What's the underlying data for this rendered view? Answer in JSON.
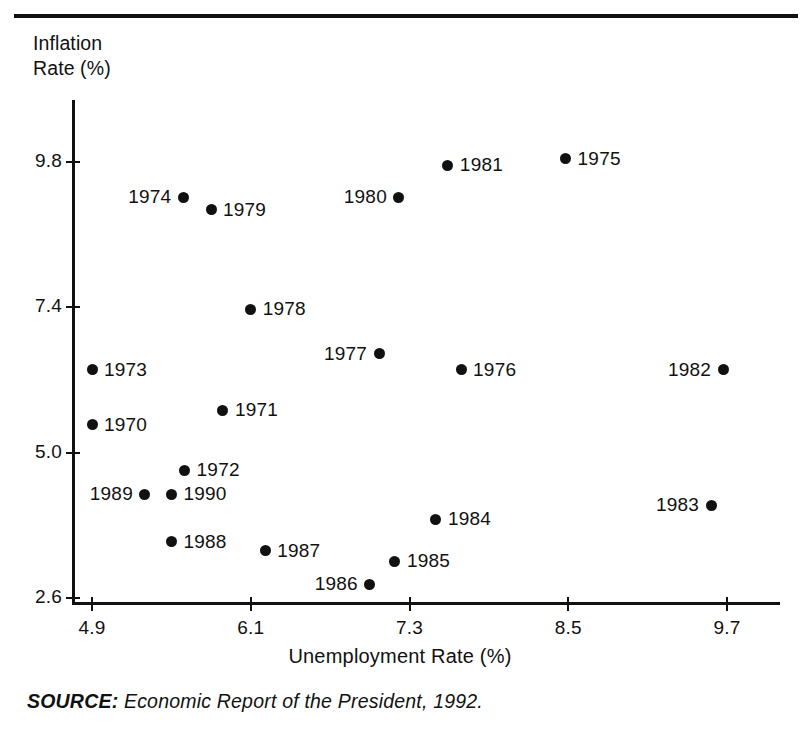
{
  "figure": {
    "y_axis_title": "Inflation\nRate (%)",
    "x_axis_title": "Unemployment Rate (%)",
    "source_keyword": "SOURCE:",
    "source_text": " Economic Report of the President, 1992.",
    "accent_color": "#111111",
    "background_color": "#ffffff"
  },
  "chart_data": {
    "type": "scatter",
    "title": "",
    "xlabel": "Unemployment Rate (%)",
    "ylabel": "Inflation Rate (%)",
    "xlim": [
      4.62,
      9.96
    ],
    "ylim": [
      2.53,
      10.5
    ],
    "grid": false,
    "legend": null,
    "xticks": [
      "4.9",
      "6.1",
      "7.3",
      "8.5",
      "9.7"
    ],
    "xtick_values": [
      4.9,
      6.1,
      7.3,
      8.5,
      9.7
    ],
    "yticks": [
      "9.8",
      "7.4",
      "5.0",
      "2.6"
    ],
    "ytick_values": [
      9.8,
      7.4,
      5.0,
      2.6
    ],
    "point_labels_note": "Each point labeled with its year",
    "points": [
      {
        "label": "1970",
        "x": 4.9,
        "y": 5.46,
        "label_side": "right"
      },
      {
        "label": "1971",
        "x": 5.89,
        "y": 5.7,
        "label_side": "right"
      },
      {
        "label": "1972",
        "x": 5.6,
        "y": 4.71,
        "label_side": "right"
      },
      {
        "label": "1973",
        "x": 4.9,
        "y": 6.37,
        "label_side": "right"
      },
      {
        "label": "1974",
        "x": 5.59,
        "y": 9.22,
        "label_side": "left"
      },
      {
        "label": "1975",
        "x": 8.48,
        "y": 9.85,
        "label_side": "right"
      },
      {
        "label": "1976",
        "x": 7.69,
        "y": 6.37,
        "label_side": "right"
      },
      {
        "label": "1977",
        "x": 7.07,
        "y": 6.63,
        "label_side": "left"
      },
      {
        "label": "1978",
        "x": 6.1,
        "y": 7.37,
        "label_side": "right"
      },
      {
        "label": "1979",
        "x": 5.8,
        "y": 9.01,
        "label_side": "right"
      },
      {
        "label": "1980",
        "x": 7.22,
        "y": 9.22,
        "label_side": "left"
      },
      {
        "label": "1981",
        "x": 7.59,
        "y": 9.75,
        "label_side": "right"
      },
      {
        "label": "1982",
        "x": 9.67,
        "y": 6.37,
        "label_side": "left"
      },
      {
        "label": "1983",
        "x": 9.58,
        "y": 4.13,
        "label_side": "left"
      },
      {
        "label": "1984",
        "x": 7.5,
        "y": 3.9,
        "label_side": "right"
      },
      {
        "label": "1985",
        "x": 7.19,
        "y": 3.21,
        "label_side": "right"
      },
      {
        "label": "1986",
        "x": 7.0,
        "y": 2.83,
        "label_side": "left"
      },
      {
        "label": "1987",
        "x": 6.21,
        "y": 3.38,
        "label_side": "right"
      },
      {
        "label": "1988",
        "x": 5.5,
        "y": 3.53,
        "label_side": "right"
      },
      {
        "label": "1989",
        "x": 5.3,
        "y": 4.31,
        "label_side": "left"
      },
      {
        "label": "1990",
        "x": 5.5,
        "y": 4.31,
        "label_side": "right"
      }
    ]
  }
}
